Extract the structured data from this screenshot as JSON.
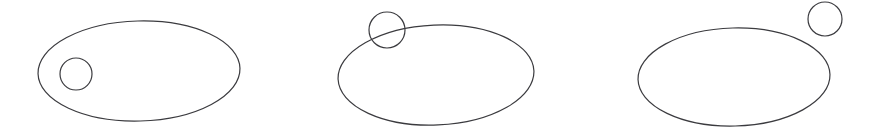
{
  "canvas": {
    "width": 876,
    "height": 140,
    "background_color": "#ffffff"
  },
  "style": {
    "stroke_color": "#3b3b3f",
    "stroke_width": 1.2,
    "fill": "none"
  },
  "diagram": {
    "type": "set-relationship-illustration",
    "panel_count": 3,
    "panels": [
      {
        "id": "panel-inside",
        "relationship": "circle-inside-ellipse",
        "ellipse": {
          "cx": 139,
          "cy": 71,
          "rx": 101,
          "ry": 50,
          "rotation": -1.5
        },
        "circle": {
          "cx": 76,
          "cy": 74,
          "r": 16
        }
      },
      {
        "id": "panel-intersecting",
        "relationship": "circle-intersecting-ellipse-boundary",
        "ellipse": {
          "cx": 436,
          "cy": 75,
          "rx": 98,
          "ry": 50,
          "rotation": -2.5
        },
        "circle": {
          "cx": 387,
          "cy": 30,
          "r": 18
        }
      },
      {
        "id": "panel-outside",
        "relationship": "circle-outside-ellipse",
        "ellipse": {
          "cx": 734,
          "cy": 77,
          "rx": 96,
          "ry": 49,
          "rotation": -1.5
        },
        "circle": {
          "cx": 825,
          "cy": 19,
          "r": 17
        }
      }
    ]
  }
}
